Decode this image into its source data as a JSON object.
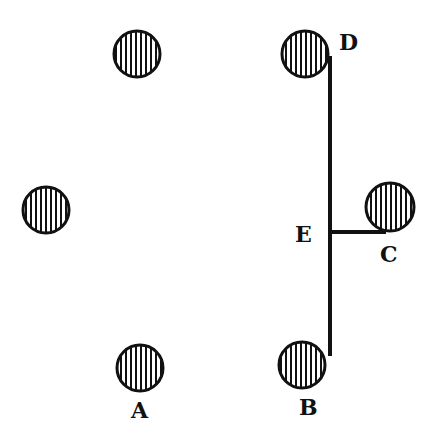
{
  "diagram": {
    "stroke_color": "#111111",
    "fill_color": "#ffffff",
    "circles": [
      {
        "id": "top-left",
        "cx": 137,
        "cy": 54,
        "r": 23
      },
      {
        "id": "D",
        "cx": 305,
        "cy": 54,
        "r": 23
      },
      {
        "id": "left",
        "cx": 46,
        "cy": 210,
        "r": 23
      },
      {
        "id": "C",
        "cx": 390,
        "cy": 207,
        "r": 24
      },
      {
        "id": "A",
        "cx": 140,
        "cy": 368,
        "r": 23
      },
      {
        "id": "B",
        "cx": 302,
        "cy": 365,
        "r": 23
      }
    ],
    "lines": [
      {
        "id": "DB",
        "x1": 330,
        "y1": 56,
        "x2": 330,
        "y2": 356,
        "width": 4
      },
      {
        "id": "EC",
        "x1": 330,
        "y1": 232,
        "x2": 386,
        "y2": 232,
        "width": 4
      }
    ],
    "labels": {
      "D": "D",
      "E": "E",
      "C": "C",
      "A": "A",
      "B": "B"
    }
  }
}
